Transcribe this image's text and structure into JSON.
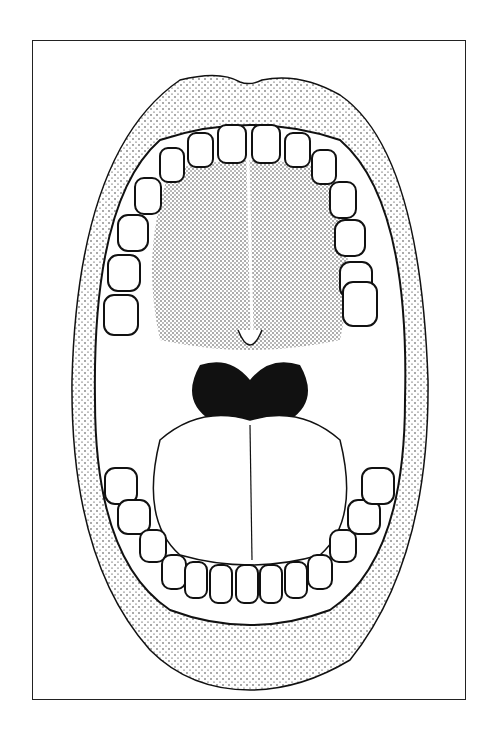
{
  "figure": {
    "style": "stippled line illustration",
    "colors": {
      "ink": "#111111",
      "paper": "#ffffff",
      "frame": "#222222"
    },
    "parts": [
      "upper-lip",
      "lower-lip",
      "upper-teeth",
      "lower-teeth",
      "hard-palate",
      "uvula",
      "tonsils",
      "throat",
      "tongue"
    ]
  }
}
